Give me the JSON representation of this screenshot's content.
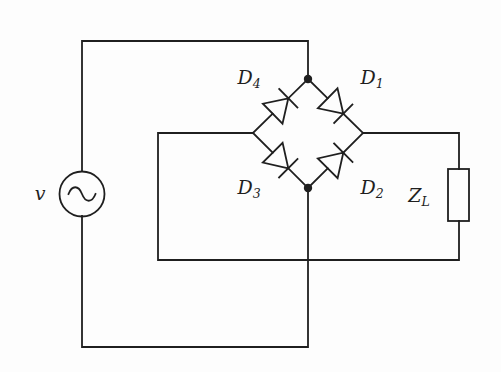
{
  "diagram": {
    "kind": "full-wave diode bridge rectifier circuit"
  },
  "colors": {
    "line": "#1f1f1f",
    "background": "#fdfdfd"
  },
  "labels": {
    "source": {
      "base": "v"
    },
    "d4": {
      "base": "D",
      "sub": "4"
    },
    "d1": {
      "base": "D",
      "sub": "1"
    },
    "d3": {
      "base": "D",
      "sub": "3"
    },
    "d2": {
      "base": "D",
      "sub": "2"
    },
    "load": {
      "base": "Z",
      "sub": "L"
    }
  }
}
